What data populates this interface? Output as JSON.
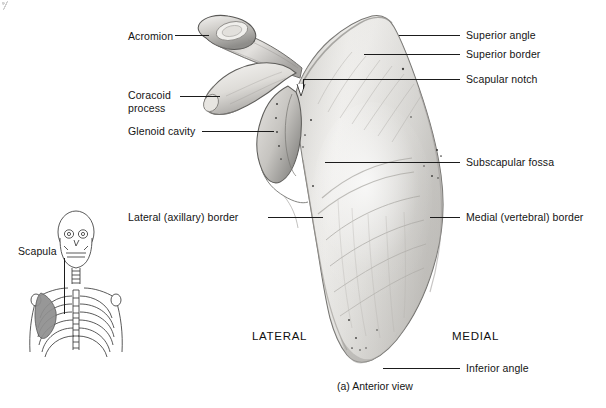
{
  "figure": {
    "caption": "(a) Anterior view",
    "subject": "scapula",
    "view": "anterior"
  },
  "labels": {
    "acromion": "Acromion",
    "coracoid_process": "Coracoid\nprocess",
    "glenoid_cavity": "Glenoid cavity",
    "lateral_axillary_border": "Lateral (axillary) border",
    "superior_angle": "Superior angle",
    "superior_border": "Superior border",
    "scapular_notch": "Scapular notch",
    "subscapular_fossa": "Subscapular fossa",
    "medial_vertebral_border": "Medial (vertebral) border",
    "inferior_angle": "Inferior angle"
  },
  "orientation": {
    "lateral": "LATERAL",
    "medial": "MEDIAL"
  },
  "inset": {
    "label": "Scapula",
    "description": "anterior skeleton torso with scapula highlighted"
  },
  "colors": {
    "background": "#ffffff",
    "text": "#141414",
    "leader_line": "#1b1b1b",
    "bone_light": "#f2f1ef",
    "bone_mid": "#d8d6d2",
    "bone_shadow": "#9b9a97",
    "bone_outline": "#6f6e6b",
    "inset_outline": "#3c3c3c",
    "inset_highlight": "#8f8f8f"
  }
}
